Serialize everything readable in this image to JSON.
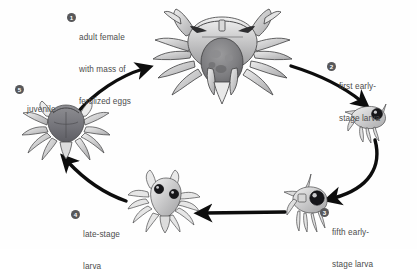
{
  "diagram": {
    "background_color": "#fefefe",
    "text_color": "#4c4c4c",
    "bullet_color": "#58585a",
    "arrow_color": "#0d0d0d",
    "stages": [
      {
        "number": "1",
        "label_lines": [
          "adult female",
          "with mass of",
          "fertilized eggs"
        ],
        "organism": "adult-female-crab-with-eggs"
      },
      {
        "number": "2",
        "label_lines": [
          "first early-",
          "stage larva"
        ],
        "organism": "first-early-stage-larva"
      },
      {
        "number": "3",
        "label_lines": [
          "fifth early-",
          "stage larva"
        ],
        "organism": "fifth-early-stage-larva"
      },
      {
        "number": "4",
        "label_lines": [
          "late-stage",
          "larva"
        ],
        "organism": "late-stage-larva"
      },
      {
        "number": "5",
        "label_lines": [
          "juvenile"
        ],
        "organism": "juvenile-crab"
      }
    ]
  }
}
